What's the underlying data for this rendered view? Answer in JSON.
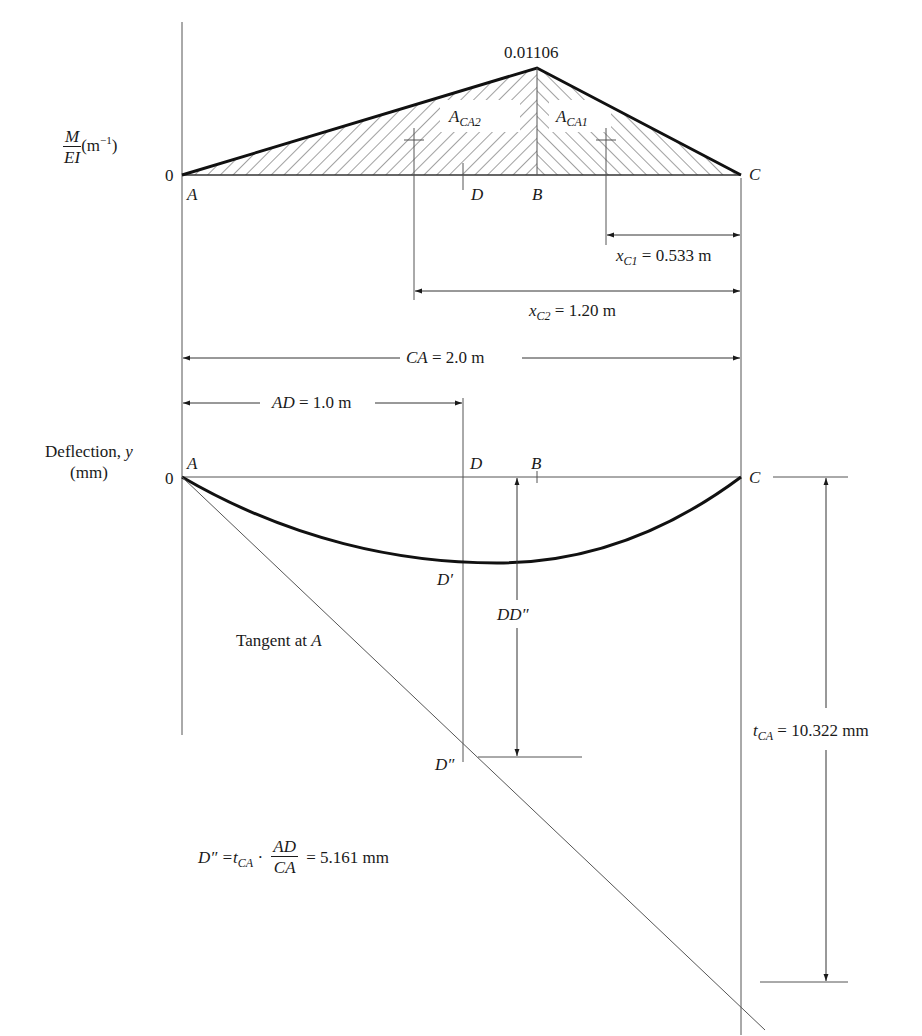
{
  "moment_diagram": {
    "axis_label_num": "M",
    "axis_label_den": "EI",
    "axis_unit_base": "(m",
    "axis_unit_exp": "−1",
    "axis_unit_close": ")",
    "zero_label": "0",
    "peak_value": "0.01106",
    "points": {
      "A": "A",
      "D": "D",
      "B": "B",
      "C": "C"
    },
    "area2_label_main": "A",
    "area2_label_sub": "CA2",
    "area1_label_main": "A",
    "area1_label_sub": "CA1",
    "x_c1_var": "x",
    "x_c1_sub": "C1",
    "x_c1_value": " = 0.533 m",
    "x_c2_var": "x",
    "x_c2_sub": "C2",
    "x_c2_value": " = 1.20 m"
  },
  "dimensions": {
    "ca_var": "CA",
    "ca_value": " = 2.0 m",
    "ad_var": "AD",
    "ad_value": " = 1.0 m"
  },
  "deflection_diagram": {
    "axis_label_line1": "Deflection, ",
    "axis_label_var": "y",
    "axis_label_line2": "(mm)",
    "zero_label": "0",
    "points": {
      "A": "A",
      "D": "D",
      "B": "B",
      "C": "C",
      "D_prime": "D′",
      "D_double_prime": "D″"
    },
    "dd_label": "DD″",
    "tangent_label_text": "Tangent at ",
    "tangent_label_var": "A",
    "tca_var": "t",
    "tca_sub": "CA",
    "tca_value": " = 10.322 mm"
  },
  "formula": {
    "lhs": "D″ = ",
    "t_var": "t",
    "t_sub": "CA",
    "dot": " · ",
    "frac_num": "AD",
    "frac_den": "CA",
    "rhs": " = 5.161 mm"
  },
  "colors": {
    "line": "#1a1a1a",
    "thin_line": "#555555",
    "hatch": "#444444",
    "background": "#ffffff"
  }
}
